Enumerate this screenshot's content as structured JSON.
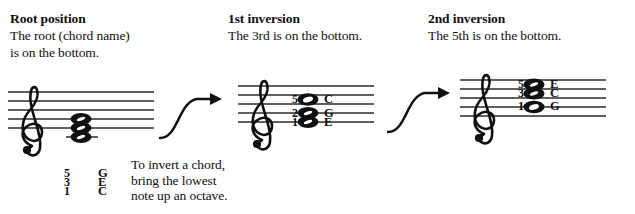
{
  "figure": {
    "title_implicit": "Chord inversions on the treble staff",
    "caption": {
      "line1": "To invert a chord,",
      "line2": "bring the lowest",
      "line3": "note up an octave."
    }
  },
  "columns": [
    {
      "id": "root-position",
      "heading": "Root position",
      "description_line1": "The root (chord name)",
      "description_line2": "is on the bottom.",
      "clef": "treble-clef",
      "chord": {
        "name": "C major triad, root position",
        "voices": [
          {
            "degree": "5",
            "letter": "G",
            "notehead": "half",
            "staff_pos": "line-2"
          },
          {
            "degree": "3",
            "letter": "E",
            "notehead": "half",
            "staff_pos": "line-1"
          },
          {
            "degree": "1",
            "letter": "C",
            "notehead": "half",
            "staff_pos": "ledger-below-1"
          }
        ]
      }
    },
    {
      "id": "first-inversion",
      "heading": "1st inversion",
      "description_line1": "The 3rd is on the bottom.",
      "description_line2": "",
      "clef": "treble-clef",
      "chord": {
        "name": "C major triad, 1st inversion",
        "voices": [
          {
            "degree": "5",
            "letter": "C",
            "notehead": "whole",
            "staff_pos": "space-3"
          },
          {
            "degree": "2",
            "letter": "G",
            "notehead": "half",
            "staff_pos": "line-2"
          },
          {
            "degree": "1",
            "letter": "E",
            "notehead": "half",
            "staff_pos": "line-1"
          }
        ]
      }
    },
    {
      "id": "second-inversion",
      "heading": "2nd inversion",
      "description_line1": "The 5th is on the bottom.",
      "description_line2": "",
      "clef": "treble-clef",
      "chord": {
        "name": "C major triad, 2nd inversion",
        "voices": [
          {
            "degree": "5",
            "letter": "E",
            "notehead": "half",
            "staff_pos": "space-4"
          },
          {
            "degree": "3",
            "letter": "C",
            "notehead": "half",
            "staff_pos": "space-3"
          },
          {
            "degree": "1",
            "letter": "G",
            "notehead": "whole",
            "staff_pos": "line-2"
          }
        ]
      }
    }
  ],
  "arrows": [
    {
      "id": "arrow-root-to-first",
      "shape": "s-curve-right",
      "label": ""
    },
    {
      "id": "arrow-first-to-second",
      "shape": "s-curve-right",
      "label": ""
    }
  ],
  "colors": {
    "ink": "#101010",
    "staff_line": "#2b2b2b",
    "background": "#ffffff"
  }
}
